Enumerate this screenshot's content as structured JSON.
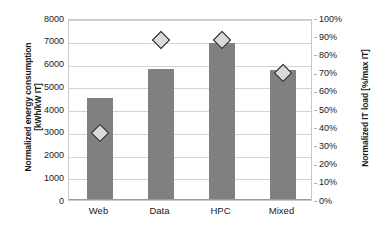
{
  "chart_data": {
    "type": "bar",
    "title": "",
    "subtitle": "",
    "categories": [
      "Web",
      "Data",
      "HPC",
      "Mixed"
    ],
    "xlabel": "",
    "ylabel": "Normalized energy consumption [kWh/kW IT]",
    "y2label": "Normalized IT load [%/max IT]",
    "ylim": [
      0,
      8000
    ],
    "y2lim": [
      0,
      100
    ],
    "ytick_step": 1000,
    "y2tick_step": 10,
    "grid": true,
    "legend": "none",
    "series": [
      {
        "name": "Normalized energy consumption",
        "type": "bar",
        "axis": "left",
        "unit": "kWh/kW IT",
        "color": "#808080",
        "values": [
          4500,
          5780,
          6900,
          5700
        ]
      },
      {
        "name": "Normalized IT load",
        "type": "scatter",
        "axis": "right",
        "unit": "%",
        "marker": "diamond",
        "marker_fill": "#d9d9d9",
        "marker_edge": "#1f1f1f",
        "values": [
          38,
          89,
          89,
          71
        ]
      }
    ],
    "ytick_labels": [
      "0",
      "1000",
      "2000",
      "3000",
      "4000",
      "5000",
      "6000",
      "7000",
      "8000"
    ],
    "y2tick_labels": [
      "0%",
      "10%",
      "20%",
      "30%",
      "40%",
      "50%",
      "60%",
      "70%",
      "80%",
      "90%",
      "100%"
    ]
  },
  "axes": {
    "left_title_line1": "Normalized energy consumption",
    "left_title_line2": "[kWh/kW IT]",
    "right_title": "Normalized IT load [%/max IT]"
  }
}
